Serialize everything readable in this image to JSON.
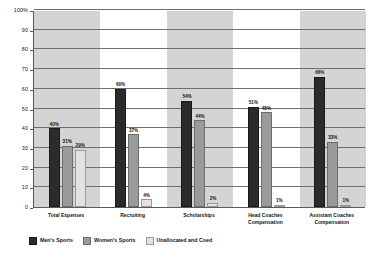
{
  "chart_data": {
    "type": "bar",
    "title": "",
    "xlabel": "",
    "ylabel": "",
    "ylim": [
      0,
      100
    ],
    "grid": true,
    "legend_position": "bottom-left",
    "categories": [
      "Total Expenses",
      "Recruiting",
      "Scholarships",
      "Head Coaches\nCompensation",
      "Assistant Coaches\nCompensation"
    ],
    "ytick_labels": [
      "100%",
      "90",
      "80",
      "70",
      "60",
      "50",
      "40",
      "30",
      "20",
      "10",
      "0"
    ],
    "ytick_values": [
      100,
      90,
      80,
      70,
      60,
      50,
      40,
      30,
      20,
      10,
      0
    ],
    "series": [
      {
        "name": "Men's Sports",
        "color": "#2b2b2b",
        "values": [
          40,
          60,
          54,
          51,
          66
        ],
        "labels": [
          "40%",
          "60%",
          "54%",
          "51%",
          "66%"
        ]
      },
      {
        "name": "Women's Sports",
        "color": "#9a9a9a",
        "values": [
          31,
          37,
          44,
          48,
          33
        ],
        "labels": [
          "31%",
          "37%",
          "44%",
          "48%",
          "33%"
        ]
      },
      {
        "name": "Unallocated and Coed",
        "color": "#e2e2e2",
        "values": [
          29,
          4,
          2,
          1,
          1
        ],
        "labels": [
          "29%",
          "4%",
          "2%",
          "1%",
          "1%"
        ]
      }
    ]
  }
}
